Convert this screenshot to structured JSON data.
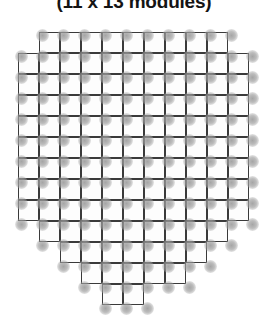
{
  "figure": {
    "title": "(11 x 13 modules)",
    "colors": {
      "module_fill": "#fdfdfd",
      "module_stroke": "#3a3a3a",
      "dot": "#9a9a9a",
      "background": "#ffffff",
      "title_text": "#141414"
    },
    "array": {
      "columns": 11,
      "rows": 13,
      "cell_size_px": 21,
      "origin_x_px": 18,
      "origin_y_px": 32,
      "dot_diameter_px": 13,
      "dot_offset_x_px": 3,
      "dot_offset_y_px": 3,
      "total_modules": 105,
      "shape": "shield",
      "row_spans": [
        {
          "row": 1,
          "start_col": 1,
          "count": 9
        },
        {
          "row": 2,
          "start_col": 0,
          "count": 11
        },
        {
          "row": 3,
          "start_col": 0,
          "count": 11
        },
        {
          "row": 4,
          "start_col": 0,
          "count": 11
        },
        {
          "row": 5,
          "start_col": 0,
          "count": 11
        },
        {
          "row": 6,
          "start_col": 0,
          "count": 11
        },
        {
          "row": 7,
          "start_col": 0,
          "count": 11
        },
        {
          "row": 8,
          "start_col": 0,
          "count": 11
        },
        {
          "row": 9,
          "start_col": 0,
          "count": 11
        },
        {
          "row": 10,
          "start_col": 1,
          "count": 9
        },
        {
          "row": 11,
          "start_col": 2,
          "count": 7
        },
        {
          "row": 12,
          "start_col": 3,
          "count": 5
        },
        {
          "row": 13,
          "start_col": 4,
          "count": 2
        }
      ]
    }
  },
  "chart_data": {
    "type": "heatmap",
    "title": "(11 x 13 modules)",
    "xlabel": "",
    "ylabel": "",
    "grid": true,
    "legend": "none",
    "columns": 11,
    "rows": 13,
    "unit": "module",
    "total_modules": 105,
    "categories": [
      "row 1",
      "row 2",
      "row 3",
      "row 4",
      "row 5",
      "row 6",
      "row 7",
      "row 8",
      "row 9",
      "row 10",
      "row 11",
      "row 12",
      "row 13"
    ],
    "values": [
      9,
      11,
      11,
      11,
      11,
      11,
      11,
      11,
      11,
      9,
      7,
      5,
      2
    ],
    "series": [
      {
        "name": "modules per row",
        "values": [
          9,
          11,
          11,
          11,
          11,
          11,
          11,
          11,
          11,
          9,
          7,
          5,
          2
        ]
      },
      {
        "name": "row start column",
        "values": [
          1,
          0,
          0,
          0,
          0,
          0,
          0,
          0,
          0,
          1,
          2,
          3,
          4
        ]
      }
    ],
    "xlim": [
      0,
      11
    ],
    "ylim": [
      0,
      13
    ]
  }
}
